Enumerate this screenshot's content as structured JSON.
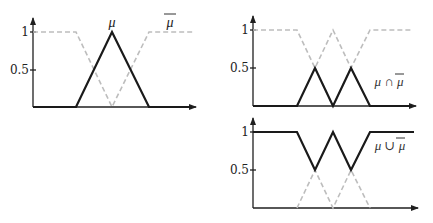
{
  "diagram": {
    "colors": {
      "solid": "#1a1a1a",
      "dashed": "#bdbdbd",
      "axis": "#1f1f1f"
    },
    "panels": [
      {
        "id": "left",
        "ticks": {
          "one": "1",
          "half": "0.5"
        },
        "labels": {
          "mu": "μ",
          "mu_bar": "μ"
        },
        "series": [
          {
            "name": "mu",
            "style": "solid",
            "points": [
              [
                0,
                0
              ],
              [
                0.3,
                0
              ],
              [
                0.5,
                1
              ],
              [
                0.7,
                0
              ],
              [
                1,
                0
              ]
            ]
          },
          {
            "name": "mu_bar",
            "style": "dashed",
            "points": [
              [
                0,
                1
              ],
              [
                0.3,
                1
              ],
              [
                0.5,
                0
              ],
              [
                0.7,
                1
              ],
              [
                1,
                1
              ]
            ]
          }
        ]
      },
      {
        "id": "top-right",
        "ticks": {
          "one": "1",
          "half": "0.5"
        },
        "labels": {
          "intersection": "μ ∩ μ"
        },
        "series": [
          {
            "name": "mu_and_mu_bar",
            "style": "solid",
            "points": [
              [
                0,
                0
              ],
              [
                0.3,
                0
              ],
              [
                0.4,
                0.5
              ],
              [
                0.5,
                0
              ],
              [
                0.6,
                0.5
              ],
              [
                0.7,
                0
              ],
              [
                1,
                0
              ]
            ]
          },
          {
            "name": "hidden_max",
            "style": "dashed",
            "points": [
              [
                0,
                1
              ],
              [
                0.3,
                1
              ],
              [
                0.4,
                0.5
              ],
              [
                0.5,
                1
              ],
              [
                0.6,
                0.5
              ],
              [
                0.7,
                1
              ],
              [
                1,
                1
              ]
            ]
          }
        ]
      },
      {
        "id": "bottom-right",
        "ticks": {
          "one": "1",
          "half": "0.5"
        },
        "labels": {
          "union": "μ ∪ μ"
        },
        "series": [
          {
            "name": "mu_or_mu_bar",
            "style": "solid",
            "points": [
              [
                0,
                1
              ],
              [
                0.3,
                1
              ],
              [
                0.4,
                0.5
              ],
              [
                0.5,
                1
              ],
              [
                0.6,
                0.5
              ],
              [
                0.7,
                1
              ],
              [
                1,
                1
              ]
            ]
          },
          {
            "name": "hidden_min",
            "style": "dashed",
            "points": [
              [
                0,
                0
              ],
              [
                0.3,
                0
              ],
              [
                0.4,
                0.5
              ],
              [
                0.5,
                0
              ],
              [
                0.6,
                0.5
              ],
              [
                0.7,
                0
              ],
              [
                1,
                0
              ]
            ]
          }
        ]
      }
    ]
  }
}
